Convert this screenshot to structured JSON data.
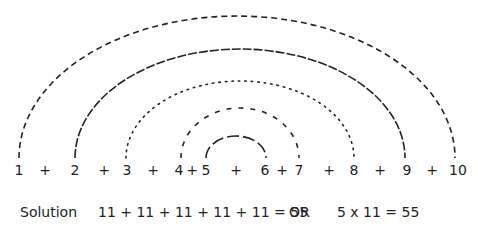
{
  "diagram": {
    "numbers_row": [
      {
        "text": "1",
        "x": 19
      },
      {
        "text": "+",
        "x": 45
      },
      {
        "text": "2",
        "x": 75
      },
      {
        "text": "+",
        "x": 104
      },
      {
        "text": "3",
        "x": 127
      },
      {
        "text": "+",
        "x": 153
      },
      {
        "text": "4",
        "x": 179
      },
      {
        "text": "+",
        "x": 192
      },
      {
        "text": "5",
        "x": 206
      },
      {
        "text": "+",
        "x": 236
      },
      {
        "text": "6",
        "x": 265
      },
      {
        "text": "+",
        "x": 282
      },
      {
        "text": "7",
        "x": 299
      },
      {
        "text": "+",
        "x": 329
      },
      {
        "text": "8",
        "x": 354
      },
      {
        "text": "+",
        "x": 380
      },
      {
        "text": "9",
        "x": 407
      },
      {
        "text": "+",
        "x": 432
      },
      {
        "text": "10",
        "x": 458
      }
    ],
    "arcs": [
      {
        "pair": "1 + 10",
        "style": "dashed",
        "cx": 237,
        "rx": 218,
        "ry": 142,
        "dash": "6 4"
      },
      {
        "pair": "2 + 9",
        "style": "long-dashed",
        "cx": 240,
        "rx": 165,
        "ry": 109,
        "dash": "9 2"
      },
      {
        "pair": "3 + 8",
        "style": "dotted",
        "cx": 240,
        "rx": 114,
        "ry": 77,
        "dash": "1.5 5"
      },
      {
        "pair": "4 + 7",
        "style": "dashed",
        "cx": 240,
        "rx": 59,
        "ry": 50,
        "dash": "5 7"
      },
      {
        "pair": "5 + 6",
        "style": "long-dashed",
        "cx": 236,
        "rx": 30,
        "ry": 22,
        "dash": "12 4"
      }
    ],
    "solution": {
      "label": "Solution",
      "expression": "11 + 11 + 11 + 11 + 11 = 55",
      "or": "OR",
      "alternative": "5 x 11 = 55"
    }
  }
}
